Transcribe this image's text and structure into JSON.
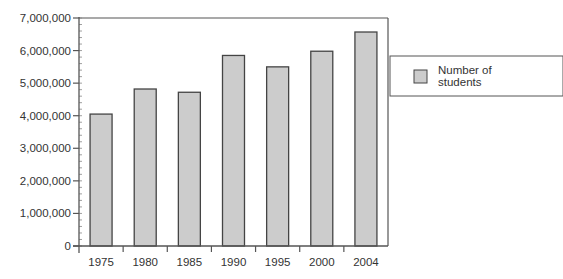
{
  "chart_data": {
    "type": "bar",
    "title": "",
    "xlabel": "",
    "ylabel": "",
    "categories": [
      "1975",
      "1980",
      "1985",
      "1990",
      "1995",
      "2000",
      "2004"
    ],
    "series": [
      {
        "name": "Number of students",
        "values": [
          4050000,
          4820000,
          4720000,
          5850000,
          5500000,
          5980000,
          6570000
        ]
      }
    ],
    "ylim": [
      0,
      7000000
    ],
    "yticks": [
      0,
      1000000,
      2000000,
      3000000,
      4000000,
      5000000,
      6000000,
      7000000
    ],
    "ytick_labels": [
      "0",
      "1,000,000",
      "2,000,000",
      "3,000,000",
      "4,000,000",
      "5,000,000",
      "6,000,000",
      "7,000,000"
    ],
    "grid": false,
    "legend": {
      "position": "right",
      "entries": [
        "Number of",
        "students"
      ]
    },
    "colors": {
      "bar_fill": "#cccccc",
      "bar_stroke": "#444444",
      "axis": "#555555"
    }
  }
}
